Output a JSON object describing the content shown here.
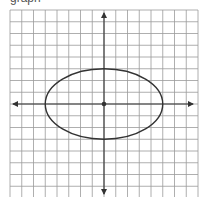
{
  "caption": "graph",
  "chart_data": {
    "type": "diagram",
    "title": "",
    "grid": {
      "cells_x": 16,
      "cells_y": 16,
      "x_range": [
        -8,
        8
      ],
      "y_range": [
        -8,
        8
      ],
      "show_grid": true
    },
    "axes": {
      "x_arrows": true,
      "y_arrows": true,
      "tick_labels": []
    },
    "shapes": [
      {
        "kind": "ellipse",
        "center": [
          0,
          0
        ],
        "semi_major_x": 5,
        "semi_minor_y": 3,
        "equation": "x^2/25 + y^2/9 = 1"
      },
      {
        "kind": "point",
        "at": [
          0,
          0
        ],
        "label": "center"
      }
    ]
  },
  "colors": {
    "grid": "#9a9a9a",
    "axis": "#333333",
    "ellipse": "#333333",
    "background": "#ffffff"
  }
}
